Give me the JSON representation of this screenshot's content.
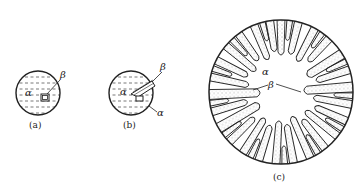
{
  "figure": {
    "panels": [
      {
        "id": "a",
        "caption": "(a)",
        "labels": {
          "matrix": "α",
          "particle": "β"
        },
        "description": "Circular α grain with a small β nucleus inside"
      },
      {
        "id": "b",
        "caption": "(b)",
        "labels": {
          "matrix_inner": "α",
          "plate": "β",
          "matrix_outer": "α"
        },
        "description": "Circular α grain with an elongated β plate growing out"
      },
      {
        "id": "c",
        "caption": "(c)",
        "labels": {
          "center": "α",
          "dendrite": "β"
        },
        "description": "Large circular grain with radial dendritic β arms growing inward toward α center"
      }
    ],
    "colors": {
      "line": "#222222",
      "background": "#ffffff",
      "dash": "#555555"
    }
  }
}
